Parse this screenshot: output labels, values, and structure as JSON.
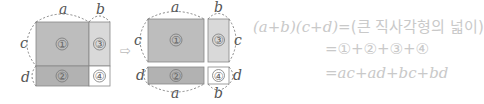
{
  "diagram": {
    "labels": {
      "a": "a",
      "b": "b",
      "c": "c",
      "d": "d"
    },
    "regions": [
      {
        "id": "1",
        "label": "①",
        "color": "#bdbdbd"
      },
      {
        "id": "2",
        "label": "②",
        "color": "#b2b2b2"
      },
      {
        "id": "3",
        "label": "③",
        "color": "#d9d9d9"
      },
      {
        "id": "4",
        "label": "④",
        "color": "#ffffff"
      }
    ],
    "arrow": "⇨"
  },
  "equation": {
    "line1_lhs": "(a+b)(c+d)",
    "line1_rhs": "=(큰 직사각형의 넓이)",
    "line2": "=①+②+③+④",
    "line3": "=ac+ad+bc+bd"
  },
  "colors": {
    "text": "#c9c9c9",
    "stroke": "#777777"
  }
}
